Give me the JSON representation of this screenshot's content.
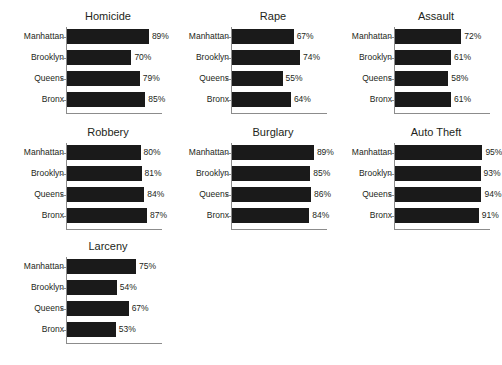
{
  "chart_data": {
    "type": "bar",
    "title": "",
    "xlabel": "",
    "ylabel": "",
    "xlim": [
      0,
      100
    ],
    "grid": false,
    "legend": "none",
    "orientation": "horizontal",
    "value_suffix": "%",
    "categories": [
      "Manhattan",
      "Brooklyn",
      "Queens",
      "Bronx"
    ],
    "panels": [
      {
        "title": "Homicide",
        "categories": [
          "Manhattan",
          "Brooklyn",
          "Queens",
          "Bronx"
        ],
        "values": [
          89,
          70,
          79,
          85
        ],
        "labels": [
          "89%",
          "70%",
          "79%",
          "85%"
        ]
      },
      {
        "title": "Rape",
        "categories": [
          "Manhattan",
          "Brooklyn",
          "Queens",
          "Bronx"
        ],
        "values": [
          67,
          74,
          55,
          64
        ],
        "labels": [
          "67%",
          "74%",
          "55%",
          "64%"
        ]
      },
      {
        "title": "Assault",
        "categories": [
          "Manhattan",
          "Brooklyn",
          "Queens",
          "Bronx"
        ],
        "values": [
          72,
          61,
          58,
          61
        ],
        "labels": [
          "72%",
          "61%",
          "58%",
          "61%"
        ]
      },
      {
        "title": "Robbery",
        "categories": [
          "Manhattan",
          "Brooklyn",
          "Queens",
          "Bronx"
        ],
        "values": [
          80,
          81,
          84,
          87
        ],
        "labels": [
          "80%",
          "81%",
          "84%",
          "87%"
        ]
      },
      {
        "title": "Burglary",
        "categories": [
          "Manhattan",
          "Brooklyn",
          "Queens",
          "Bronx"
        ],
        "values": [
          89,
          85,
          86,
          84
        ],
        "labels": [
          "89%",
          "85%",
          "86%",
          "84%"
        ]
      },
      {
        "title": "Auto Theft",
        "categories": [
          "Manhattan",
          "Brooklyn",
          "Queens",
          "Bronx"
        ],
        "values": [
          95,
          93,
          94,
          91
        ],
        "labels": [
          "95%",
          "93%",
          "94%",
          "91%"
        ]
      },
      {
        "title": "Larceny",
        "categories": [
          "Manhattan",
          "Brooklyn",
          "Queens",
          "Bronx"
        ],
        "values": [
          75,
          54,
          67,
          53
        ],
        "labels": [
          "75%",
          "54%",
          "67%",
          "53%"
        ]
      }
    ],
    "colors": {
      "bar": "#1a1a1a",
      "axis": "#8c8c8c",
      "text": "#231f20",
      "background": "#ffffff"
    }
  }
}
